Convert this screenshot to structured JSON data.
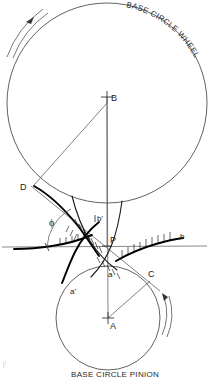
{
  "figure": {
    "title_top": "BASE CIRCLE WHEEL",
    "title_bottom": "BASE CIRCLE PINION"
  },
  "labels": {
    "center_wheel": "B",
    "center_pinion": "A",
    "tangent_point_wheel": "D",
    "tangent_point_pinion": "C",
    "pitch_point": "P",
    "pressure_angle": "ϕ",
    "profile_a": "a",
    "profile_a_prime": "a'",
    "profile_b": "b",
    "profile_b_prime": "b'"
  },
  "colors": {
    "ink": "#000000",
    "thin_line": "#4a4a4a",
    "circle_line": "#3a3a3a",
    "background": "#ffffff"
  },
  "geometry": {
    "wheel_center": [
      107,
      103
    ],
    "wheel_radius": 100,
    "pinion_center": [
      108,
      318
    ],
    "pinion_radius": 52,
    "pitch_point": [
      107,
      246
    ],
    "pitch_line_y": 246,
    "tangent_D": [
      34,
      185
    ],
    "tangent_C": [
      150,
      281
    ],
    "pressure_angle_deg": 39
  },
  "annotations": {
    "wheel_rotation": "counterclockwise",
    "pinion_rotation": "clockwise"
  }
}
